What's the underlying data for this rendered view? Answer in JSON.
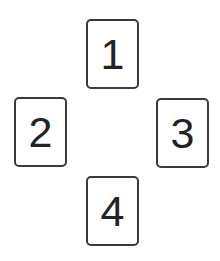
{
  "cards": [
    {
      "label": "1",
      "position": "top"
    },
    {
      "label": "2",
      "position": "left"
    },
    {
      "label": "3",
      "position": "right"
    },
    {
      "label": "4",
      "position": "bottom"
    }
  ],
  "colors": {
    "border": "#3a3a3a",
    "text": "#222222",
    "background": "#ffffff"
  }
}
